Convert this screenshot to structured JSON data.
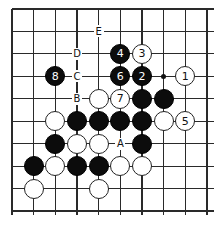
{
  "diagram": {
    "type": "go-board-fragment",
    "grid": {
      "cols": 10,
      "rows": 10,
      "x0": 12,
      "y0": 9,
      "dx": 21.67,
      "dy": 22.45,
      "open_right": true,
      "open_bottom": true
    },
    "colors": {
      "black": "#0c0c0c",
      "white": "#ffffff",
      "line": "#2a2a2a"
    },
    "star_points": [
      {
        "c": 7,
        "r": 3
      }
    ],
    "stones": [
      {
        "c": 5,
        "r": 2,
        "color": "black",
        "label": "4"
      },
      {
        "c": 6,
        "r": 2,
        "color": "white",
        "label": "3"
      },
      {
        "c": 2,
        "r": 3,
        "color": "black",
        "label": "8"
      },
      {
        "c": 5,
        "r": 3,
        "color": "black",
        "label": "6"
      },
      {
        "c": 6,
        "r": 3,
        "color": "black",
        "label": "2"
      },
      {
        "c": 8,
        "r": 3,
        "color": "white",
        "label": "1"
      },
      {
        "c": 4,
        "r": 4,
        "color": "white",
        "label": ""
      },
      {
        "c": 5,
        "r": 4,
        "color": "white",
        "label": "7"
      },
      {
        "c": 6,
        "r": 4,
        "color": "black",
        "label": ""
      },
      {
        "c": 7,
        "r": 4,
        "color": "black",
        "label": ""
      },
      {
        "c": 2,
        "r": 5,
        "color": "white",
        "label": ""
      },
      {
        "c": 3,
        "r": 5,
        "color": "black",
        "label": ""
      },
      {
        "c": 4,
        "r": 5,
        "color": "black",
        "label": ""
      },
      {
        "c": 5,
        "r": 5,
        "color": "black",
        "label": ""
      },
      {
        "c": 6,
        "r": 5,
        "color": "black",
        "label": ""
      },
      {
        "c": 7,
        "r": 5,
        "color": "white",
        "label": ""
      },
      {
        "c": 8,
        "r": 5,
        "color": "white",
        "label": "5"
      },
      {
        "c": 2,
        "r": 6,
        "color": "black",
        "label": ""
      },
      {
        "c": 3,
        "r": 6,
        "color": "white",
        "label": ""
      },
      {
        "c": 4,
        "r": 6,
        "color": "white",
        "label": ""
      },
      {
        "c": 6,
        "r": 6,
        "color": "black",
        "label": ""
      },
      {
        "c": 1,
        "r": 7,
        "color": "black",
        "label": ""
      },
      {
        "c": 2,
        "r": 7,
        "color": "white",
        "label": ""
      },
      {
        "c": 3,
        "r": 7,
        "color": "black",
        "label": ""
      },
      {
        "c": 4,
        "r": 7,
        "color": "black",
        "label": ""
      },
      {
        "c": 5,
        "r": 7,
        "color": "white",
        "label": ""
      },
      {
        "c": 6,
        "r": 7,
        "color": "white",
        "label": ""
      },
      {
        "c": 1,
        "r": 8,
        "color": "white",
        "label": ""
      },
      {
        "c": 4,
        "r": 8,
        "color": "white",
        "label": ""
      }
    ],
    "point_labels": [
      {
        "c": 4,
        "r": 1,
        "text": "E"
      },
      {
        "c": 3,
        "r": 2,
        "text": "D"
      },
      {
        "c": 3,
        "r": 3,
        "text": "C"
      },
      {
        "c": 3,
        "r": 4,
        "text": "B"
      },
      {
        "c": 5,
        "r": 6,
        "text": "A"
      }
    ]
  }
}
